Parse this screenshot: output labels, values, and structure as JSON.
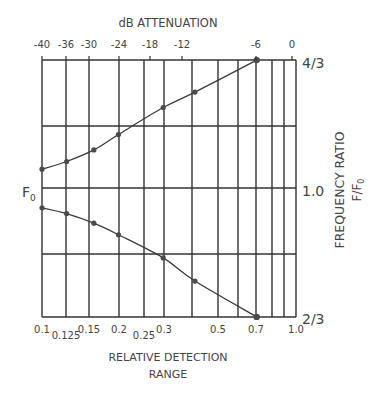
{
  "chart_data": {
    "type": "line",
    "title": "dB ATTENUATION",
    "top_axis": {
      "label": "dB ATTENUATION",
      "ticks": [
        "-40",
        "-36",
        "-30",
        "-24",
        "-18",
        "-12",
        "-6",
        "0"
      ],
      "tick_x": [
        42,
        66,
        89,
        119,
        150,
        182,
        256,
        292
      ]
    },
    "bottom_axis": {
      "label_line1": "RELATIVE DETECTION",
      "label_line2": "RANGE",
      "ticks": [
        "0.1",
        "0.125",
        "0.15",
        "0.2",
        "0.25",
        "0.3",
        "0.5",
        "0.7",
        "1.0"
      ],
      "tick_x": [
        42,
        66,
        89,
        119,
        144,
        164,
        218,
        256,
        296
      ]
    },
    "right_axis": {
      "label": "FREQUENCY RATIO",
      "sublabel": "F/F0",
      "ticks": [
        "4/3",
        "1.0",
        "2/3"
      ],
      "tick_values": [
        1.3333,
        1.0,
        0.6667
      ]
    },
    "left_marker": "F0",
    "xlabel": "RELATIVE DETECTION RANGE",
    "ylabel": "FREQUENCY RATIO F/F0",
    "xscale": "log",
    "xlim": [
      0.1,
      1.0
    ],
    "ylim": [
      0.6667,
      1.3333
    ],
    "grid": true,
    "series": [
      {
        "name": "upper",
        "x": [
          0.1,
          0.125,
          0.16,
          0.2,
          0.3,
          0.4,
          0.7
        ],
        "db": [
          -40,
          -36,
          -32,
          -28,
          -21,
          -16,
          -6
        ],
        "y": [
          1.05,
          1.07,
          1.1,
          1.14,
          1.21,
          1.25,
          1.333
        ]
      },
      {
        "name": "lower",
        "x": [
          0.1,
          0.125,
          0.16,
          0.2,
          0.3,
          0.4,
          0.7
        ],
        "db": [
          -40,
          -36,
          -32,
          -28,
          -21,
          -16,
          -6
        ],
        "y": [
          0.95,
          0.935,
          0.91,
          0.88,
          0.82,
          0.76,
          0.667
        ]
      }
    ]
  }
}
